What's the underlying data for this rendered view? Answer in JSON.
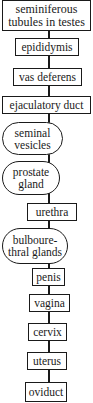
{
  "diagram": {
    "type": "flowchart",
    "orientation": "vertical",
    "colors": {
      "stroke": "#1a1a1a",
      "fill": "#ffffff",
      "text": "#1a1a1a"
    },
    "nodes": [
      {
        "id": "seminiferous",
        "shape": "rect",
        "line1": "seminiferous",
        "line2": "tubules in testes"
      },
      {
        "id": "epididymis",
        "shape": "rect",
        "label": "epididymis"
      },
      {
        "id": "vas-deferens",
        "shape": "rect",
        "label": "vas deferens"
      },
      {
        "id": "ejaculatory-duct",
        "shape": "rect",
        "label": "ejaculatory duct"
      },
      {
        "id": "seminal-vesicles",
        "shape": "pill",
        "line1": "seminal",
        "line2": "vesicles"
      },
      {
        "id": "prostate-gland",
        "shape": "pill",
        "line1": "prostate",
        "line2": "gland"
      },
      {
        "id": "urethra",
        "shape": "rect",
        "label": "urethra"
      },
      {
        "id": "bulbourethral-glands",
        "shape": "pill",
        "line1": "bulboure-",
        "line2": "thral glands"
      },
      {
        "id": "penis",
        "shape": "rect",
        "label": "penis"
      },
      {
        "id": "vagina",
        "shape": "rect",
        "label": "vagina"
      },
      {
        "id": "cervix",
        "shape": "rect",
        "label": "cervix"
      },
      {
        "id": "uterus",
        "shape": "rect",
        "label": "uterus"
      },
      {
        "id": "oviduct",
        "shape": "rect",
        "label": "oviduct"
      }
    ]
  }
}
